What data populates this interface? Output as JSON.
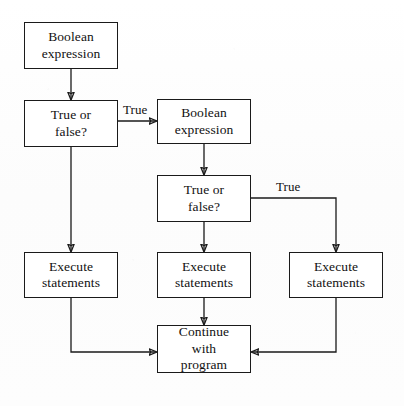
{
  "diagram": {
    "type": "flowchart",
    "background_color": "#fdfdfd",
    "line_color": "#1a1a1a",
    "text_color": "#111111",
    "nodes": [
      {
        "id": "boolean-expression-1",
        "label": "Boolean\nexpression",
        "shape": "rectangle",
        "x": 24,
        "y": 22,
        "w": 94,
        "h": 47
      },
      {
        "id": "true-or-false-1",
        "label": "True or\nfalse?",
        "shape": "rectangle",
        "x": 24,
        "y": 100,
        "w": 94,
        "h": 47
      },
      {
        "id": "boolean-expression-2",
        "label": "Boolean\nexpression",
        "shape": "rectangle",
        "x": 157,
        "y": 99,
        "w": 94,
        "h": 45
      },
      {
        "id": "true-or-false-2",
        "label": "True or\nfalse?",
        "shape": "rectangle",
        "x": 157,
        "y": 175,
        "w": 94,
        "h": 47
      },
      {
        "id": "execute-statements-left",
        "label": "Execute\nstatements",
        "shape": "rectangle",
        "x": 24,
        "y": 252,
        "w": 94,
        "h": 46
      },
      {
        "id": "execute-statements-middle",
        "label": "Execute\nstatements",
        "shape": "rectangle",
        "x": 157,
        "y": 252,
        "w": 94,
        "h": 46
      },
      {
        "id": "execute-statements-right",
        "label": "Execute\nstatements",
        "shape": "rectangle",
        "x": 289,
        "y": 252,
        "w": 94,
        "h": 46
      },
      {
        "id": "continue-with-program",
        "label": "Continue\nwith\nprogram",
        "shape": "rectangle",
        "x": 157,
        "y": 325,
        "w": 94,
        "h": 48
      }
    ],
    "edge_labels": [
      {
        "id": "true-label-1",
        "text": "True",
        "x": 123,
        "y": 103
      },
      {
        "id": "true-label-2",
        "text": "True",
        "x": 276,
        "y": 180
      }
    ],
    "edges": [
      {
        "id": "edge-bool1-to-decision1",
        "from": "boolean-expression-1",
        "to": "true-or-false-1",
        "kind": "straight-down",
        "arrow": true
      },
      {
        "id": "edge-decision1-true-to-bool2",
        "from": "true-or-false-1",
        "to": "boolean-expression-2",
        "kind": "right",
        "label": "True",
        "arrow": true
      },
      {
        "id": "edge-decision1-false-to-execute-left",
        "from": "true-or-false-1",
        "to": "execute-statements-left",
        "kind": "straight-down",
        "arrow": true
      },
      {
        "id": "edge-bool2-to-decision2",
        "from": "boolean-expression-2",
        "to": "true-or-false-2",
        "kind": "straight-down",
        "arrow": true
      },
      {
        "id": "edge-decision2-true-to-execute-right",
        "from": "true-or-false-2",
        "to": "execute-statements-right",
        "kind": "right-then-down",
        "label": "True",
        "arrow": true
      },
      {
        "id": "edge-decision2-false-to-execute-middle",
        "from": "true-or-false-2",
        "to": "execute-statements-middle",
        "kind": "straight-down",
        "arrow": true
      },
      {
        "id": "edge-execute-left-to-continue",
        "from": "execute-statements-left",
        "to": "continue-with-program",
        "kind": "down-then-right",
        "arrow": true
      },
      {
        "id": "edge-execute-middle-to-continue",
        "from": "execute-statements-middle",
        "to": "continue-with-program",
        "kind": "straight-down",
        "arrow": true
      },
      {
        "id": "edge-execute-right-to-continue",
        "from": "execute-statements-right",
        "to": "continue-with-program",
        "kind": "down-then-left",
        "arrow": true
      }
    ]
  }
}
